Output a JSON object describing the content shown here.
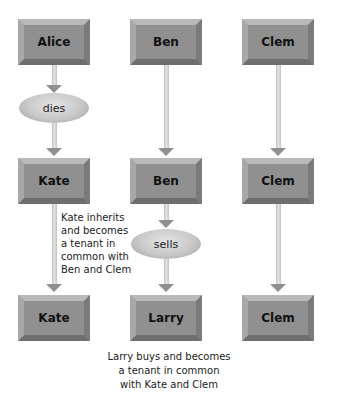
{
  "columns": [
    {
      "boxes": [
        "Alice",
        "Kate",
        "Kate"
      ],
      "event": "dies",
      "note_lines": [
        "Kate inherits",
        "and becomes",
        "a tenant in",
        "common with",
        "Ben and Clem"
      ]
    },
    {
      "boxes": [
        "Ben",
        "Ben",
        "Larry"
      ],
      "event": "sells",
      "note_lines": [
        "Larry buys and becomes",
        "a tenant in common",
        "with Kate and Clem"
      ]
    },
    {
      "boxes": [
        "Clem",
        "Clem",
        "Clem"
      ]
    }
  ],
  "colors": {
    "box_face": "#909090",
    "oval": "#c8c8c8",
    "arrow_shaft": "#d4d4d4",
    "arrow_head": "#8f8f8f",
    "text": "#111111"
  }
}
